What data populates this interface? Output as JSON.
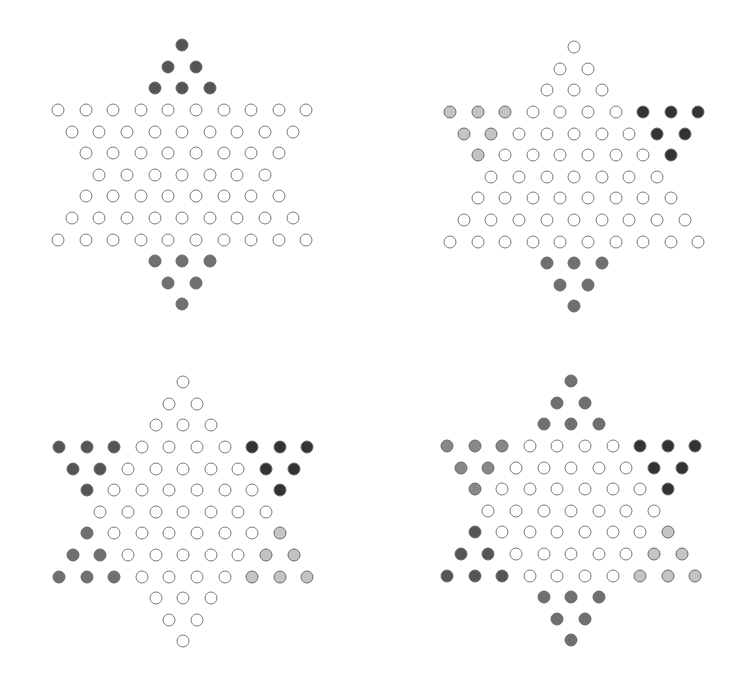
{
  "colors": {
    "empty": "#ffffff",
    "dark": "#333333",
    "darkgray": "#555555",
    "gray": "#707070",
    "midgray": "#888888",
    "lightgray": "#c4c4c4"
  },
  "layout": {
    "spacing_x": 27.6,
    "spacing_y": 21.6
  },
  "boards": [
    {
      "name": "board-two-players",
      "origin": [
        58,
        110
      ],
      "regions": {
        "top": "darkgray",
        "upper_left": "empty",
        "upper_right": "empty",
        "lower_left": "empty",
        "lower_right": "empty",
        "bottom": "gray"
      }
    },
    {
      "name": "board-three-players",
      "origin": [
        450,
        112
      ],
      "regions": {
        "top": "empty",
        "upper_left": "lightgray",
        "upper_right": "dark",
        "lower_left": "empty",
        "lower_right": "empty",
        "bottom": "gray"
      }
    },
    {
      "name": "board-four-players",
      "origin": [
        59,
        447
      ],
      "regions": {
        "top": "empty",
        "upper_left": "darkgray",
        "upper_right": "dark",
        "lower_left": "gray",
        "lower_right": "lightgray",
        "bottom": "empty"
      }
    },
    {
      "name": "board-six-players",
      "origin": [
        447,
        446
      ],
      "regions": {
        "top": "gray",
        "upper_left": "midgray",
        "upper_right": "dark",
        "lower_left": "darkgray",
        "lower_right": "lightgray",
        "bottom": "gray"
      }
    }
  ]
}
